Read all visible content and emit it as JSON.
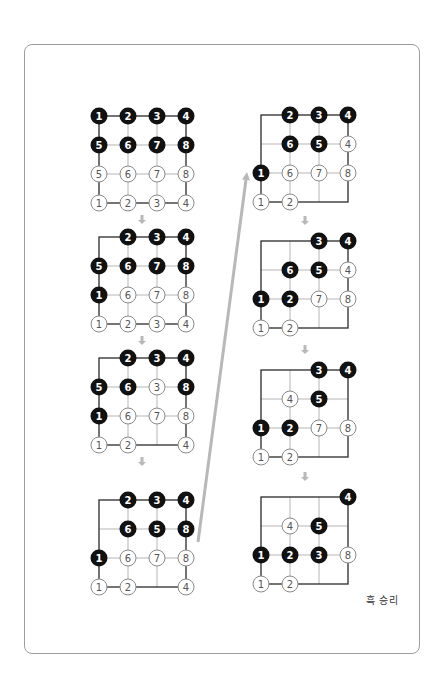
{
  "figure": {
    "result_label": "흑 승리",
    "colors": {
      "card_border": "#9c9c9c",
      "grid_line_light": "#b5b5b5",
      "grid_line_dark": "#2a2a2a",
      "black_stone": "#111111",
      "white_stone_fill": "#ffffff",
      "white_stone_stroke": "#8a8a8a",
      "arrow": "#b8b8b8"
    },
    "grid": {
      "cols": 4,
      "rows": 4,
      "spacing": 29,
      "stone_radius": 8.5
    },
    "icons": {
      "step_arrow": "down-arrow-icon",
      "jump_arrow": "diagonal-up-arrow-icon"
    },
    "boards": [
      {
        "id": "step-1",
        "column": "left",
        "origin": [
          99,
          116
        ],
        "stones": [
          {
            "c": 0,
            "r": 0,
            "color": "black",
            "n": "1"
          },
          {
            "c": 1,
            "r": 0,
            "color": "black",
            "n": "2"
          },
          {
            "c": 2,
            "r": 0,
            "color": "black",
            "n": "3"
          },
          {
            "c": 3,
            "r": 0,
            "color": "black",
            "n": "4"
          },
          {
            "c": 0,
            "r": 1,
            "color": "black",
            "n": "5"
          },
          {
            "c": 1,
            "r": 1,
            "color": "black",
            "n": "6"
          },
          {
            "c": 2,
            "r": 1,
            "color": "black",
            "n": "7"
          },
          {
            "c": 3,
            "r": 1,
            "color": "black",
            "n": "8"
          },
          {
            "c": 0,
            "r": 2,
            "color": "white",
            "n": "5"
          },
          {
            "c": 1,
            "r": 2,
            "color": "white",
            "n": "6"
          },
          {
            "c": 2,
            "r": 2,
            "color": "white",
            "n": "7"
          },
          {
            "c": 3,
            "r": 2,
            "color": "white",
            "n": "8"
          },
          {
            "c": 0,
            "r": 3,
            "color": "white",
            "n": "1"
          },
          {
            "c": 1,
            "r": 3,
            "color": "white",
            "n": "2"
          },
          {
            "c": 2,
            "r": 3,
            "color": "white",
            "n": "3"
          },
          {
            "c": 3,
            "r": 3,
            "color": "white",
            "n": "4"
          }
        ]
      },
      {
        "id": "step-2",
        "column": "left",
        "origin": [
          99,
          237
        ],
        "stones": [
          {
            "c": 1,
            "r": 0,
            "color": "black",
            "n": "2"
          },
          {
            "c": 2,
            "r": 0,
            "color": "black",
            "n": "3"
          },
          {
            "c": 3,
            "r": 0,
            "color": "black",
            "n": "4"
          },
          {
            "c": 0,
            "r": 1,
            "color": "black",
            "n": "5"
          },
          {
            "c": 1,
            "r": 1,
            "color": "black",
            "n": "6"
          },
          {
            "c": 2,
            "r": 1,
            "color": "black",
            "n": "7"
          },
          {
            "c": 3,
            "r": 1,
            "color": "black",
            "n": "8"
          },
          {
            "c": 0,
            "r": 2,
            "color": "black",
            "n": "1"
          },
          {
            "c": 1,
            "r": 2,
            "color": "white",
            "n": "6"
          },
          {
            "c": 2,
            "r": 2,
            "color": "white",
            "n": "7"
          },
          {
            "c": 3,
            "r": 2,
            "color": "white",
            "n": "8"
          },
          {
            "c": 0,
            "r": 3,
            "color": "white",
            "n": "1"
          },
          {
            "c": 1,
            "r": 3,
            "color": "white",
            "n": "2"
          },
          {
            "c": 2,
            "r": 3,
            "color": "white",
            "n": "3"
          },
          {
            "c": 3,
            "r": 3,
            "color": "white",
            "n": "4"
          }
        ]
      },
      {
        "id": "step-3",
        "column": "left",
        "origin": [
          99,
          358
        ],
        "stones": [
          {
            "c": 1,
            "r": 0,
            "color": "black",
            "n": "2"
          },
          {
            "c": 2,
            "r": 0,
            "color": "black",
            "n": "3"
          },
          {
            "c": 3,
            "r": 0,
            "color": "black",
            "n": "4"
          },
          {
            "c": 0,
            "r": 1,
            "color": "black",
            "n": "5"
          },
          {
            "c": 1,
            "r": 1,
            "color": "black",
            "n": "6"
          },
          {
            "c": 2,
            "r": 1,
            "color": "white",
            "n": "3"
          },
          {
            "c": 3,
            "r": 1,
            "color": "black",
            "n": "8"
          },
          {
            "c": 0,
            "r": 2,
            "color": "black",
            "n": "1"
          },
          {
            "c": 1,
            "r": 2,
            "color": "white",
            "n": "6"
          },
          {
            "c": 2,
            "r": 2,
            "color": "white",
            "n": "7"
          },
          {
            "c": 3,
            "r": 2,
            "color": "white",
            "n": "8"
          },
          {
            "c": 0,
            "r": 3,
            "color": "white",
            "n": "1"
          },
          {
            "c": 1,
            "r": 3,
            "color": "white",
            "n": "2"
          },
          {
            "c": 3,
            "r": 3,
            "color": "white",
            "n": "4"
          }
        ]
      },
      {
        "id": "step-4",
        "column": "left",
        "origin": [
          99,
          500
        ],
        "stones": [
          {
            "c": 1,
            "r": 0,
            "color": "black",
            "n": "2"
          },
          {
            "c": 2,
            "r": 0,
            "color": "black",
            "n": "3"
          },
          {
            "c": 3,
            "r": 0,
            "color": "black",
            "n": "4"
          },
          {
            "c": 1,
            "r": 1,
            "color": "black",
            "n": "6"
          },
          {
            "c": 2,
            "r": 1,
            "color": "black",
            "n": "5"
          },
          {
            "c": 3,
            "r": 1,
            "color": "black",
            "n": "8"
          },
          {
            "c": 0,
            "r": 2,
            "color": "black",
            "n": "1"
          },
          {
            "c": 1,
            "r": 2,
            "color": "white",
            "n": "6"
          },
          {
            "c": 2,
            "r": 2,
            "color": "white",
            "n": "7"
          },
          {
            "c": 3,
            "r": 2,
            "color": "white",
            "n": "8"
          },
          {
            "c": 0,
            "r": 3,
            "color": "white",
            "n": "1"
          },
          {
            "c": 1,
            "r": 3,
            "color": "white",
            "n": "2"
          },
          {
            "c": 3,
            "r": 3,
            "color": "white",
            "n": "4"
          }
        ]
      },
      {
        "id": "step-5",
        "column": "right",
        "origin": [
          261,
          115
        ],
        "stones": [
          {
            "c": 1,
            "r": 0,
            "color": "black",
            "n": "2"
          },
          {
            "c": 2,
            "r": 0,
            "color": "black",
            "n": "3"
          },
          {
            "c": 3,
            "r": 0,
            "color": "black",
            "n": "4"
          },
          {
            "c": 1,
            "r": 1,
            "color": "black",
            "n": "6"
          },
          {
            "c": 2,
            "r": 1,
            "color": "black",
            "n": "5"
          },
          {
            "c": 3,
            "r": 1,
            "color": "white",
            "n": "4"
          },
          {
            "c": 0,
            "r": 2,
            "color": "black",
            "n": "1"
          },
          {
            "c": 1,
            "r": 2,
            "color": "white",
            "n": "6"
          },
          {
            "c": 2,
            "r": 2,
            "color": "white",
            "n": "7"
          },
          {
            "c": 3,
            "r": 2,
            "color": "white",
            "n": "8"
          },
          {
            "c": 0,
            "r": 3,
            "color": "white",
            "n": "1"
          },
          {
            "c": 1,
            "r": 3,
            "color": "white",
            "n": "2"
          }
        ]
      },
      {
        "id": "step-6",
        "column": "right",
        "origin": [
          261,
          241
        ],
        "stones": [
          {
            "c": 2,
            "r": 0,
            "color": "black",
            "n": "3"
          },
          {
            "c": 3,
            "r": 0,
            "color": "black",
            "n": "4"
          },
          {
            "c": 1,
            "r": 1,
            "color": "black",
            "n": "6"
          },
          {
            "c": 2,
            "r": 1,
            "color": "black",
            "n": "5"
          },
          {
            "c": 3,
            "r": 1,
            "color": "white",
            "n": "4"
          },
          {
            "c": 0,
            "r": 2,
            "color": "black",
            "n": "1"
          },
          {
            "c": 1,
            "r": 2,
            "color": "black",
            "n": "2"
          },
          {
            "c": 2,
            "r": 2,
            "color": "white",
            "n": "7"
          },
          {
            "c": 3,
            "r": 2,
            "color": "white",
            "n": "8"
          },
          {
            "c": 0,
            "r": 3,
            "color": "white",
            "n": "1"
          },
          {
            "c": 1,
            "r": 3,
            "color": "white",
            "n": "2"
          }
        ]
      },
      {
        "id": "step-7",
        "column": "right",
        "origin": [
          261,
          370
        ],
        "stones": [
          {
            "c": 2,
            "r": 0,
            "color": "black",
            "n": "3"
          },
          {
            "c": 3,
            "r": 0,
            "color": "black",
            "n": "4"
          },
          {
            "c": 1,
            "r": 1,
            "color": "white",
            "n": "4"
          },
          {
            "c": 2,
            "r": 1,
            "color": "black",
            "n": "5"
          },
          {
            "c": 0,
            "r": 2,
            "color": "black",
            "n": "1"
          },
          {
            "c": 1,
            "r": 2,
            "color": "black",
            "n": "2"
          },
          {
            "c": 2,
            "r": 2,
            "color": "white",
            "n": "7"
          },
          {
            "c": 3,
            "r": 2,
            "color": "white",
            "n": "8"
          },
          {
            "c": 0,
            "r": 3,
            "color": "white",
            "n": "1"
          },
          {
            "c": 1,
            "r": 3,
            "color": "white",
            "n": "2"
          }
        ]
      },
      {
        "id": "step-8",
        "column": "right",
        "origin": [
          261,
          497
        ],
        "stones": [
          {
            "c": 3,
            "r": 0,
            "color": "black",
            "n": "4"
          },
          {
            "c": 1,
            "r": 1,
            "color": "white",
            "n": "4"
          },
          {
            "c": 2,
            "r": 1,
            "color": "black",
            "n": "5"
          },
          {
            "c": 0,
            "r": 2,
            "color": "black",
            "n": "1"
          },
          {
            "c": 1,
            "r": 2,
            "color": "black",
            "n": "2"
          },
          {
            "c": 2,
            "r": 2,
            "color": "black",
            "n": "3"
          },
          {
            "c": 3,
            "r": 2,
            "color": "white",
            "n": "8"
          },
          {
            "c": 0,
            "r": 3,
            "color": "white",
            "n": "1"
          },
          {
            "c": 1,
            "r": 3,
            "color": "white",
            "n": "2"
          }
        ]
      }
    ],
    "step_arrows": [
      {
        "x": 142,
        "y": 215
      },
      {
        "x": 142,
        "y": 336
      },
      {
        "x": 142,
        "y": 457
      },
      {
        "x": 305,
        "y": 216
      },
      {
        "x": 305,
        "y": 345
      },
      {
        "x": 305,
        "y": 472
      }
    ],
    "jump_arrow": {
      "from": [
        198,
        542
      ],
      "to": [
        247,
        172
      ]
    }
  }
}
